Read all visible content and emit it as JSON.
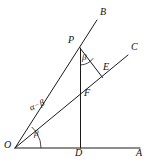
{
  "figure": {
    "type": "geometry-diagram",
    "width": 149,
    "height": 165,
    "background_color": "#ffffff",
    "stroke_color": "#1a1a1a"
  },
  "points": [
    {
      "id": "O",
      "label": "O",
      "x": 15,
      "y": 148,
      "label_x": 4,
      "label_y": 144
    },
    {
      "id": "A",
      "label": "A",
      "x": 140,
      "y": 148,
      "label_x": 136,
      "label_y": 151
    },
    {
      "id": "B",
      "label": "B",
      "x": 97,
      "y": 20,
      "label_x": 100,
      "label_y": 9
    },
    {
      "id": "C",
      "label": "C",
      "x": 128,
      "y": 55,
      "label_x": 131,
      "label_y": 45
    },
    {
      "id": "P",
      "label": "P",
      "x": 80,
      "y": 48,
      "label_x": 68,
      "label_y": 37
    },
    {
      "id": "D",
      "label": "D",
      "x": 81,
      "y": 148,
      "label_x": 76,
      "label_y": 151
    },
    {
      "id": "E",
      "label": "E",
      "x": 102,
      "y": 77,
      "label_x": 103,
      "label_y": 64
    },
    {
      "id": "F",
      "label": "F",
      "x": 81,
      "y": 96,
      "label_x": 84,
      "label_y": 92
    }
  ],
  "segments": [
    {
      "id": "OA",
      "from": "O",
      "to": "A",
      "description": "horizontal base ray"
    },
    {
      "id": "OB",
      "from": "O",
      "to": "B",
      "description": "ray through P"
    },
    {
      "id": "OC",
      "from": "O",
      "to": "C",
      "description": "ray through F and E"
    },
    {
      "id": "PD",
      "from": "P",
      "to": "D",
      "description": "vertical altitude through F"
    },
    {
      "id": "PE",
      "from": "P",
      "to": "E",
      "description": "segment from apex to E on OC"
    }
  ],
  "angles": [
    {
      "id": "angle-at-O-beta",
      "label": "β",
      "vertex": "O",
      "between": [
        "OA",
        "OC"
      ],
      "label_x": 34,
      "label_y": 133
    },
    {
      "id": "angle-at-O-alpha-minus-beta",
      "label": "α−β",
      "vertex": "O",
      "between": [
        "OC",
        "OB"
      ],
      "label_x": 33,
      "label_y": 108
    },
    {
      "id": "angle-at-P-beta",
      "label": "β",
      "vertex": "P",
      "between": [
        "PD",
        "PE"
      ],
      "label_x": 82,
      "label_y": 57
    }
  ]
}
